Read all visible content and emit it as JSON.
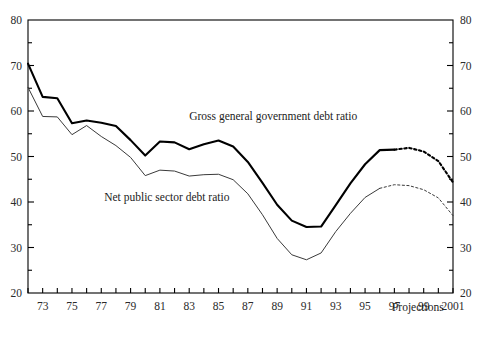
{
  "chart_data": {
    "type": "line",
    "title": "",
    "xlabel": "",
    "ylabel": "",
    "xlim": [
      1972,
      2001
    ],
    "ylim": [
      20,
      80
    ],
    "grid": false,
    "legend_position": "inline-annotation",
    "y_ticks": [
      20,
      30,
      40,
      50,
      60,
      70,
      80
    ],
    "y_tick_labels": [
      "20",
      "30",
      "40",
      "50",
      "60",
      "70",
      "80"
    ],
    "y_minor_ticks": [
      25,
      35,
      45,
      55,
      65,
      75
    ],
    "x_ticks": [
      1972,
      1973,
      1974,
      1975,
      1976,
      1977,
      1978,
      1979,
      1980,
      1981,
      1982,
      1983,
      1984,
      1985,
      1986,
      1987,
      1988,
      1989,
      1990,
      1991,
      1992,
      1993,
      1994,
      1995,
      1996,
      1997,
      1998,
      1999,
      2000,
      2001
    ],
    "x_tick_labels": [
      "73",
      "75",
      "77",
      "79",
      "81",
      "83",
      "85",
      "87",
      "89",
      "91",
      "93",
      "95",
      "97",
      "99",
      "2001"
    ],
    "x_labeled_years": [
      1973,
      1975,
      1977,
      1979,
      1981,
      1983,
      1985,
      1987,
      1989,
      1991,
      1993,
      1995,
      1997,
      1999,
      2001
    ],
    "annotations": [
      {
        "text": "Gross general government debt ratio",
        "x": 1983.0,
        "y": 58.0
      },
      {
        "text": "Net public sector debt ratio",
        "x": 1977.2,
        "y": 40.2
      },
      {
        "text": "Projections",
        "x": 1998.6,
        "y": 16.0
      }
    ],
    "series": [
      {
        "name": "Gross general government debt ratio",
        "style": "solid-thick",
        "color": "#000000",
        "x": [
          1972,
          1973,
          1974,
          1975,
          1976,
          1977,
          1978,
          1979,
          1980,
          1981,
          1982,
          1983,
          1984,
          1985,
          1986,
          1987,
          1988,
          1989,
          1990,
          1991,
          1992,
          1993,
          1994,
          1995,
          1996,
          1997
        ],
        "values": [
          70.4,
          63.1,
          62.8,
          57.3,
          57.9,
          57.4,
          56.7,
          53.6,
          50.2,
          53.3,
          53.1,
          51.6,
          52.7,
          53.5,
          52.2,
          48.8,
          44.2,
          39.4,
          35.9,
          34.5,
          34.6,
          39.3,
          44.1,
          48.3,
          51.4,
          51.5
        ]
      },
      {
        "name": "Gross general government debt ratio (projection)",
        "style": "dotted-thick",
        "color": "#000000",
        "x": [
          1997,
          1998,
          1999,
          2000,
          2001
        ],
        "values": [
          51.5,
          51.9,
          51.1,
          49.0,
          44.3
        ]
      },
      {
        "name": "Net public sector debt ratio",
        "style": "solid-thin",
        "color": "#3a3a3a",
        "x": [
          1972,
          1973,
          1974,
          1975,
          1976,
          1977,
          1978,
          1979,
          1980,
          1981,
          1982,
          1983,
          1984,
          1985,
          1986,
          1987,
          1988,
          1989,
          1990,
          1991,
          1992,
          1993,
          1994,
          1995,
          1996
        ],
        "values": [
          65.2,
          58.8,
          58.7,
          54.8,
          56.8,
          54.4,
          52.4,
          49.8,
          45.8,
          47.0,
          46.8,
          45.7,
          46.0,
          46.1,
          44.9,
          41.8,
          37.2,
          32.0,
          28.4,
          27.3,
          28.8,
          33.5,
          37.5,
          41.0,
          43.0
        ]
      },
      {
        "name": "Net public sector debt ratio (projection)",
        "style": "dotted-thin",
        "color": "#3a3a3a",
        "x": [
          1996,
          1997,
          1998,
          1999,
          2000,
          2001
        ],
        "values": [
          43.0,
          43.8,
          43.6,
          42.7,
          40.9,
          37.0
        ]
      }
    ]
  },
  "labels": {
    "gross_series": "Gross general government debt ratio",
    "net_series": "Net public sector debt ratio",
    "projections": "Projections"
  }
}
